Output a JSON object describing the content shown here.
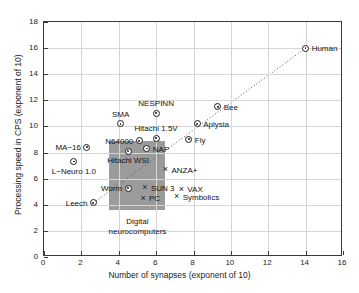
{
  "chart_data": {
    "type": "scatter",
    "title": "",
    "xlabel": "Number of synapses (exponent of 10)",
    "ylabel": "Processing speed in CPS (exponent of 10)",
    "xlim": [
      0,
      16
    ],
    "ylim": [
      0,
      18
    ],
    "xticks": [
      0,
      2,
      4,
      6,
      8,
      10,
      12,
      14,
      16
    ],
    "yticks": [
      0,
      2,
      4,
      6,
      8,
      10,
      12,
      14,
      16,
      18
    ],
    "grid": true,
    "legend": "none",
    "series": [
      {
        "name": "Biological nervous systems",
        "marker": "circle",
        "points": [
          {
            "label": "Leech",
            "x": 2.65,
            "y": 4.15,
            "label_pos": "left"
          },
          {
            "label": "Fly",
            "x": 7.75,
            "y": 9.0,
            "label_pos": "right"
          },
          {
            "label": "Aplysia",
            "x": 8.2,
            "y": 10.2,
            "label_pos": "right"
          },
          {
            "label": "Bee",
            "x": 9.3,
            "y": 11.5,
            "label_pos": "right"
          },
          {
            "label": "Human",
            "x": 14.0,
            "y": 16.0,
            "label_pos": "right"
          }
        ]
      },
      {
        "name": "Neurocomputer hardware",
        "marker": "circle",
        "points": [
          {
            "label": "MA−16",
            "x": 2.3,
            "y": 8.4,
            "label_pos": "left"
          },
          {
            "label": "L−Neuro 1.0",
            "x": 1.6,
            "y": 7.3,
            "label_pos": "below"
          },
          {
            "label": "SMA",
            "x": 4.1,
            "y": 10.2,
            "label_pos": "above"
          },
          {
            "label": "NESPINN",
            "x": 6.0,
            "y": 11.0,
            "label_pos": "above"
          },
          {
            "label": "Hitachi 1.5V",
            "x": 6.0,
            "y": 9.1,
            "label_pos": "above"
          },
          {
            "label": "N64000",
            "x": 5.1,
            "y": 8.9,
            "label_pos": "left"
          },
          {
            "label": "Hitachi WSI",
            "x": 4.5,
            "y": 8.1,
            "label_pos": "below"
          },
          {
            "label": "NAP",
            "x": 5.5,
            "y": 8.3,
            "label_pos": "right"
          },
          {
            "label": "Worm",
            "x": 4.5,
            "y": 5.25,
            "label_pos": "left"
          }
        ]
      },
      {
        "name": "General purpose computers",
        "marker": "cross",
        "points": [
          {
            "label": "ANZA+",
            "x": 6.5,
            "y": 6.7,
            "label_pos": "right"
          },
          {
            "label": "SUN 3",
            "x": 5.4,
            "y": 5.3,
            "label_pos": "right"
          },
          {
            "label": "PC",
            "x": 5.3,
            "y": 4.5,
            "label_pos": "right"
          },
          {
            "label": "VAX",
            "x": 7.35,
            "y": 5.2,
            "label_pos": "right"
          },
          {
            "label": "Symbolics",
            "x": 7.1,
            "y": 4.6,
            "label_pos": "right"
          }
        ]
      }
    ],
    "annotations": [
      {
        "name": "digital-neurocomputers-region",
        "type": "rect",
        "x0": 3.5,
        "x1": 6.5,
        "y0": 3.6,
        "y1": 8.85,
        "color": "#9b9b9b",
        "label_line1": "Digital",
        "label_line2": "neurocomputers",
        "label_x": 5.0,
        "label_y": 3.05
      },
      {
        "name": "diagonal-trend-line",
        "type": "line",
        "style": "dotted",
        "x0": 2.65,
        "y0": 4.15,
        "x1": 14.0,
        "y1": 16.0
      }
    ]
  }
}
